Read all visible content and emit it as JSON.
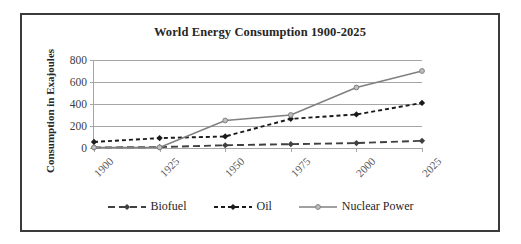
{
  "chart_data": {
    "type": "line",
    "title": "World Energy Consumption 1900-2025",
    "xlabel": "",
    "ylabel": "Consumption in Exajoules",
    "categories": [
      "1900",
      "1925",
      "1950",
      "1975",
      "2000",
      "2025"
    ],
    "x": [
      1900,
      1925,
      1950,
      1975,
      2000,
      2025
    ],
    "ylim": [
      0,
      800
    ],
    "yticks": [
      0,
      200,
      400,
      600,
      800
    ],
    "ytick_labels": [
      "0",
      "200",
      "400",
      "600",
      "800"
    ],
    "grid": "horizontal",
    "legend_position": "bottom",
    "series": [
      {
        "name": "Biofuel",
        "values": [
          5,
          8,
          25,
          35,
          45,
          65
        ],
        "color": "#404040",
        "line_style": "long-dash",
        "marker": "diamond"
      },
      {
        "name": "Oil",
        "values": [
          55,
          90,
          105,
          265,
          305,
          410
        ],
        "color": "#1a1a1a",
        "line_style": "short-dash",
        "marker": "diamond"
      },
      {
        "name": "Nuclear Power",
        "values": [
          5,
          5,
          250,
          300,
          550,
          700
        ],
        "color": "#808080",
        "line_style": "solid",
        "marker": "circle"
      }
    ]
  },
  "legend": {
    "items": [
      {
        "label": "Biofuel"
      },
      {
        "label": "Oil"
      },
      {
        "label": "Nuclear Power"
      }
    ]
  },
  "colors": {
    "frame": "#3a3a3a",
    "gridline": "#a6a6a6",
    "title_text": "#262626",
    "tick_text": "#595959",
    "background": "#ffffff"
  }
}
